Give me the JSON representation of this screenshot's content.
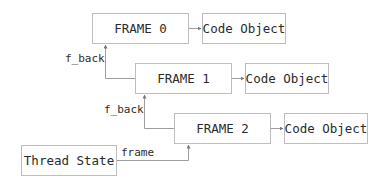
{
  "diagram": {
    "frames": [
      {
        "label": "FRAME 0",
        "code_label": "Code Object"
      },
      {
        "label": "FRAME 1",
        "code_label": "Code Object"
      },
      {
        "label": "FRAME 2",
        "code_label": "Code Object"
      }
    ],
    "thread_state": {
      "label": "Thread State"
    },
    "edges": {
      "f_back_1": "f_back",
      "f_back_2": "f_back",
      "frame": "frame"
    },
    "colors": {
      "border": "#bdbdbd",
      "line": "#9e9e9e",
      "text": "#2b2b2b"
    }
  }
}
